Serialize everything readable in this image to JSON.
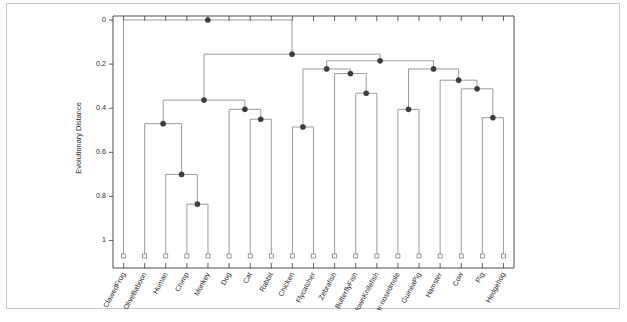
{
  "figure": {
    "border_color": "#c9c9c9",
    "background": "#ffffff"
  },
  "axis": {
    "y_title": "Evolutionary Distance",
    "y_ticks": [
      "0",
      "0.2",
      "0.4",
      "0.6",
      "0.8",
      "1"
    ],
    "y_tick_values": [
      0,
      0.2,
      0.4,
      0.6,
      0.8,
      1.0
    ],
    "axis_color": "#3a3a3a",
    "link_color": "#8a8a8a",
    "node_color": "#3d3d3d"
  },
  "chart_data": {
    "type": "dendrogram",
    "title": "",
    "xlabel": "",
    "ylabel": "Evolutionary Distance",
    "ylim": [
      0,
      1.07
    ],
    "y_inverted": true,
    "grid": false,
    "legend": "none",
    "leaf_count": 18,
    "leaf_labels": [
      "ClawedFrog",
      "OliveBaboon",
      "Human",
      "Chimp",
      "Monkey",
      "Dog",
      "Cat",
      "Rabbit",
      "Chicken",
      "Flycatcher",
      "Zebrafish",
      "ButterflyFish",
      "ClownKnifefish",
      "Star-nosedmole",
      "GuineaPig",
      "Hamster",
      "Cow",
      "Pig",
      "Hedgehog"
    ],
    "leaf_baseline_value": 1.07,
    "merges": [
      {
        "id": "m1",
        "label": "Chimp + Monkey",
        "height": 0.835,
        "children": [
          "Chimp",
          "Monkey"
        ]
      },
      {
        "id": "m2",
        "label": "Human + (Chimp,Monkey)",
        "height": 0.7,
        "children": [
          "Human",
          "m1"
        ]
      },
      {
        "id": "m3",
        "label": "OliveBaboon + primates",
        "height": 0.47,
        "children": [
          "OliveBaboon",
          "m2"
        ]
      },
      {
        "id": "m4",
        "label": "Cat + Rabbit",
        "height": 0.45,
        "children": [
          "Cat",
          "Rabbit"
        ]
      },
      {
        "id": "m5",
        "label": "Dog + (Cat,Rabbit)",
        "height": 0.405,
        "children": [
          "Dog",
          "m4"
        ]
      },
      {
        "id": "m6",
        "label": "primates + carnivores",
        "height": 0.363,
        "children": [
          "m3",
          "m5"
        ]
      },
      {
        "id": "m7",
        "label": "Chicken + Flycatcher",
        "height": 0.485,
        "children": [
          "Chicken",
          "Flycatcher"
        ]
      },
      {
        "id": "m8",
        "label": "ButterflyFish + ClownKnifefish",
        "height": 0.332,
        "children": [
          "ButterflyFish",
          "ClownKnifefish"
        ]
      },
      {
        "id": "m9",
        "label": "Zebrafish + m8",
        "height": 0.243,
        "children": [
          "Zebrafish",
          "m8"
        ]
      },
      {
        "id": "m10",
        "label": "birds + fish",
        "height": 0.222,
        "children": [
          "m7",
          "m9"
        ]
      },
      {
        "id": "m11",
        "label": "Star-nosedmole + GuineaPig",
        "height": 0.405,
        "children": [
          "Star-nosedmole",
          "GuineaPig"
        ]
      },
      {
        "id": "m12",
        "label": "Pig + Hedgehog",
        "height": 0.443,
        "children": [
          "Pig",
          "Hedgehog"
        ]
      },
      {
        "id": "m13",
        "label": "Cow + (Pig,Hedgehog)",
        "height": 0.312,
        "children": [
          "Cow",
          "m12"
        ]
      },
      {
        "id": "m14",
        "label": "Hamster + m13",
        "height": 0.273,
        "children": [
          "Hamster",
          "m13"
        ]
      },
      {
        "id": "m15",
        "label": "mole/guineapig + ungulates",
        "height": 0.222,
        "children": [
          "m11",
          "m14"
        ]
      },
      {
        "id": "m16",
        "label": "m10 + m15",
        "height": 0.185,
        "children": [
          "m10",
          "m15"
        ]
      },
      {
        "id": "m17",
        "label": "m6 + m16",
        "height": 0.155,
        "children": [
          "m6",
          "m16"
        ]
      },
      {
        "id": "m18",
        "label": "ClawedFrog + all",
        "height": 0.0,
        "children": [
          "ClawedFrog",
          "m17"
        ]
      }
    ]
  }
}
